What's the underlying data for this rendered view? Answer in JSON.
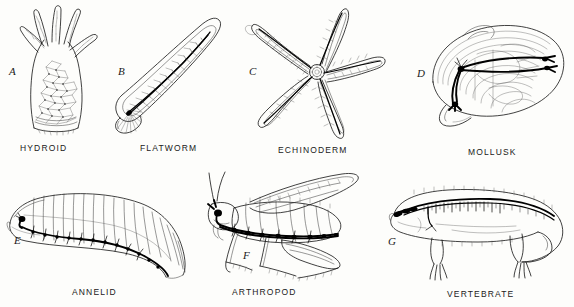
{
  "figure": {
    "background_color": "#fdfdfb",
    "ink_color": "#111111",
    "panel_count": 7
  },
  "panels": [
    {
      "letter": "A",
      "caption": "HYDROID",
      "icon": "hydroid-nerve-net-drawing",
      "nervous_system": "diffuse nerve net",
      "row": 1,
      "column": 1
    },
    {
      "letter": "B",
      "caption": "FLATWORM",
      "icon": "flatworm-ladder-nervous-system-drawing",
      "nervous_system": "ladder-type with cerebral ganglia and paired longitudinal nerve cords",
      "row": 1,
      "column": 2
    },
    {
      "letter": "C",
      "caption": "ECHINODERM",
      "icon": "starfish-radial-nerve-drawing",
      "nervous_system": "radial nerve ring with five radial nerves",
      "row": 1,
      "column": 3
    },
    {
      "letter": "D",
      "caption": "MOLLUSK",
      "icon": "clam-ganglia-drawing",
      "nervous_system": "paired ganglia joined by commissures",
      "row": 1,
      "column": 4
    },
    {
      "letter": "E",
      "caption": "ANNELID",
      "icon": "earthworm-ventral-nerve-cord-drawing",
      "nervous_system": "ventral nerve cord with segmental ganglia",
      "row": 2,
      "column": 1
    },
    {
      "letter": "F",
      "caption": "ARTHROPOD",
      "icon": "grasshopper-ventral-nerve-cord-drawing",
      "nervous_system": "brain and ventral nerve cord with segmental ganglia",
      "row": 2,
      "column": 2
    },
    {
      "letter": "G",
      "caption": "VERTEBRATE",
      "icon": "salamander-dorsal-spinal-cord-drawing",
      "nervous_system": "dorsal hollow nerve cord, brain and spinal nerves",
      "row": 2,
      "column": 3
    }
  ]
}
